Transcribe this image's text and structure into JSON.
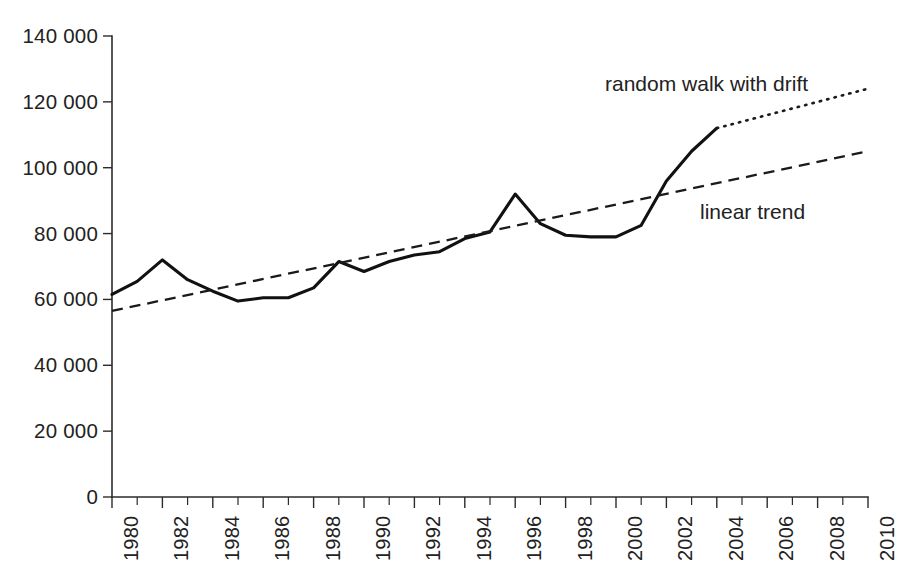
{
  "chart_data": {
    "type": "line",
    "title": "",
    "subtitle": "",
    "xlabel": "",
    "ylabel": "",
    "xlim": [
      1980,
      2010
    ],
    "ylim": [
      0,
      140000
    ],
    "grid": false,
    "legend_position": "inline-annotations",
    "y_ticks": [
      0,
      20000,
      40000,
      60000,
      80000,
      100000,
      120000,
      140000
    ],
    "y_tick_labels": [
      "0",
      "20 000",
      "40 000",
      "60 000",
      "80 000",
      "100 000",
      "120 000",
      "140 000"
    ],
    "x_ticks": [
      1980,
      1981,
      1982,
      1983,
      1984,
      1985,
      1986,
      1987,
      1988,
      1989,
      1990,
      1991,
      1992,
      1993,
      1994,
      1995,
      1996,
      1997,
      1998,
      1999,
      2000,
      2001,
      2002,
      2003,
      2004,
      2005,
      2006,
      2007,
      2008,
      2009,
      2010
    ],
    "x_tick_labels": [
      "1980",
      "1982",
      "1984",
      "1986",
      "1988",
      "1990",
      "1992",
      "1994",
      "1996",
      "1998",
      "2000",
      "2002",
      "2004",
      "2006",
      "2008",
      "2010"
    ],
    "x_tick_label_years": [
      1980,
      1982,
      1984,
      1986,
      1988,
      1990,
      1992,
      1994,
      1996,
      1998,
      2000,
      2002,
      2004,
      2006,
      2008,
      2010
    ],
    "series": [
      {
        "name": "observed",
        "style": "solid",
        "x": [
          1980,
          1981,
          1982,
          1983,
          1984,
          1985,
          1986,
          1987,
          1988,
          1989,
          1990,
          1991,
          1992,
          1993,
          1994,
          1995,
          1996,
          1997,
          1998,
          1999,
          2000,
          2001,
          2002,
          2003,
          2004
        ],
        "values": [
          61500,
          65500,
          72000,
          66000,
          62500,
          59500,
          60500,
          60500,
          63500,
          71500,
          68500,
          71500,
          73500,
          74500,
          78500,
          80500,
          92000,
          83000,
          79500,
          79000,
          79000,
          82500,
          96000,
          105000,
          112000
        ]
      },
      {
        "name": "linear trend",
        "style": "dashed",
        "x": [
          1980,
          2010
        ],
        "values": [
          56500,
          105000
        ]
      },
      {
        "name": "random walk with drift",
        "style": "dotted",
        "x": [
          2004,
          2010
        ],
        "values": [
          112000,
          124000
        ]
      }
    ],
    "annotations": [
      {
        "id": "random-walk-label",
        "text": "random walk with drift",
        "x_px": 605,
        "y_px": 72
      },
      {
        "id": "linear-trend-label",
        "text": "linear trend",
        "x_px": 700,
        "y_px": 200
      }
    ],
    "colors": {
      "axis": "#2b2b2b",
      "series": "#111111",
      "trend": "#1a1a1a",
      "forecast": "#1a1a1a",
      "background": "#ffffff"
    }
  }
}
